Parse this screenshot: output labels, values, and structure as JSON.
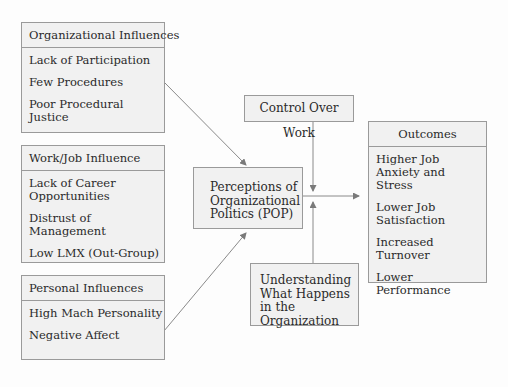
{
  "organizational_influences": {
    "title": "Organizational Influences",
    "items": [
      "Lack of Participation",
      "Few Procedures",
      "Poor Procedural Justice"
    ]
  },
  "work_job_influence": {
    "title": "Work/Job Influence",
    "items": [
      "Lack of Career Opportunities",
      "Distrust of Management",
      "Low LMX (Out-Group)"
    ]
  },
  "personal_influences": {
    "title": "Personal Influences",
    "items": [
      "High Mach Personality",
      "Negative Affect"
    ]
  },
  "pop": {
    "label": "Perceptions of Organizational Politics (POP)"
  },
  "control_over_work": {
    "label": "Control Over Work"
  },
  "understanding": {
    "label": "Understanding What Happens in the Organization"
  },
  "outcomes": {
    "title": "Outcomes",
    "items": [
      "Higher Job Anxiety and Stress",
      "Lower Job Satisfaction",
      "Increased Turnover",
      "Lower Performance"
    ]
  }
}
